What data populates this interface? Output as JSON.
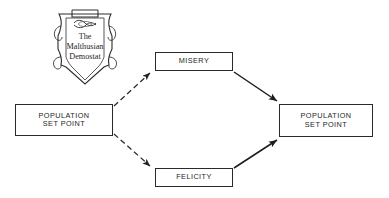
{
  "figure": {
    "title": "The Malthusian Demostat",
    "background_color": "#ffffff",
    "stroke_color": "#2a2a2a",
    "text_color": "#262626"
  },
  "emblem": {
    "name": "malthusian-demostat-shield",
    "shape": "scroll-banner-shield",
    "caption_line1": "The",
    "caption_line2": "Malthusian",
    "caption_line3": "Demostat"
  },
  "nodes": [
    {
      "id": "population-set-point-left",
      "line1": "POPULATION",
      "line2": "SET POINT"
    },
    {
      "id": "misery",
      "line1": "MISERY"
    },
    {
      "id": "felicity",
      "line1": "FELICITY"
    },
    {
      "id": "population-set-point-right",
      "line1": "POPULATION",
      "line2": "SET POINT"
    }
  ],
  "edges": [
    {
      "id": "left-to-misery",
      "from": "population-set-point-left",
      "to": "misery",
      "style": "dashed",
      "arrowhead": "filled"
    },
    {
      "id": "left-to-felicity",
      "from": "population-set-point-left",
      "to": "felicity",
      "style": "dashed",
      "arrowhead": "filled"
    },
    {
      "id": "misery-to-right",
      "from": "misery",
      "to": "population-set-point-right",
      "style": "solid",
      "arrowhead": "filled"
    },
    {
      "id": "felicity-to-right",
      "from": "felicity",
      "to": "population-set-point-right",
      "style": "solid",
      "arrowhead": "filled"
    }
  ]
}
